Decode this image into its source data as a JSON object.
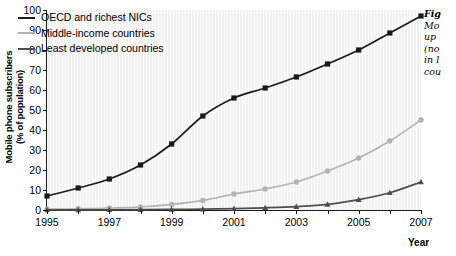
{
  "chart_data": {
    "type": "line",
    "title": "",
    "xlabel": "Year",
    "ylabel_line1": "Mobile phone subscribers",
    "ylabel_line2": "(% of population)",
    "x": [
      1995,
      1996,
      1997,
      1998,
      1999,
      2000,
      2001,
      2002,
      2003,
      2004,
      2005,
      2006,
      2007
    ],
    "xlim": [
      1995,
      2007
    ],
    "ylim": [
      0,
      100
    ],
    "ytick_values": [
      0,
      10,
      20,
      30,
      40,
      50,
      60,
      70,
      80,
      90,
      100
    ],
    "xtick_values": [
      1995,
      1996,
      1997,
      1998,
      1999,
      2000,
      2001,
      2002,
      2003,
      2004,
      2005,
      2006,
      2007
    ],
    "xtick_labels": [
      "1995",
      "",
      "1997",
      "",
      "1999",
      "",
      "2001",
      "",
      "2003",
      "",
      "2005",
      "",
      "2007"
    ],
    "grid": false,
    "legend_position": "upper left",
    "series": [
      {
        "name": "OECD and richest NICs",
        "color": "#1a1a1a",
        "marker": "square",
        "values": [
          7,
          11,
          15.5,
          22.5,
          33,
          47,
          56,
          61,
          66.5,
          73,
          80,
          88.5,
          97
        ]
      },
      {
        "name": "Middle-income countries",
        "color": "#b3b3b3",
        "marker": "circle",
        "values": [
          0.4,
          0.6,
          1.0,
          1.5,
          2.8,
          4.8,
          8,
          10.5,
          14,
          19.5,
          26,
          34.5,
          45
        ]
      },
      {
        "name": "Least developed countries",
        "color": "#4d4d4d",
        "marker": "triangle",
        "values": [
          0.05,
          0.08,
          0.12,
          0.2,
          0.3,
          0.45,
          0.7,
          1.1,
          1.7,
          2.8,
          5.2,
          8.6,
          14
        ]
      }
    ]
  },
  "legend": {
    "items": [
      {
        "label": "OECD and richest NICs",
        "color": "#1a1a1a"
      },
      {
        "label": "Middle-income countries",
        "color": "#b3b3b3"
      },
      {
        "label": "Least developed countries",
        "color": "#4d4d4d"
      }
    ]
  },
  "caption": {
    "lines": [
      "Fig",
      "Mo",
      "up",
      "(no",
      "in l",
      "cou"
    ]
  }
}
